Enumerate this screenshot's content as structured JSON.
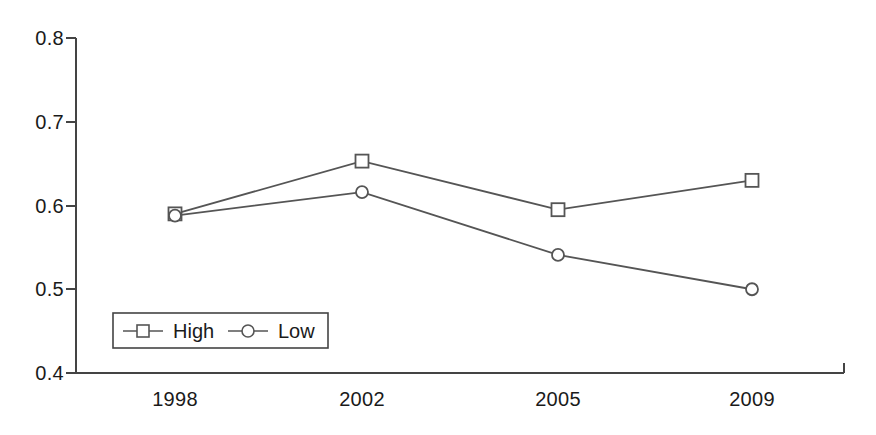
{
  "chart_data": {
    "type": "line",
    "title": "",
    "xlabel": "",
    "ylabel": "",
    "categories": [
      "1998",
      "2002",
      "2005",
      "2009"
    ],
    "series": [
      {
        "name": "High",
        "marker": "square",
        "values": [
          0.59,
          0.653,
          0.595,
          0.63
        ]
      },
      {
        "name": "Low",
        "marker": "circle",
        "values": [
          0.588,
          0.616,
          0.541,
          0.5
        ]
      }
    ],
    "ylim": [
      0.4,
      0.8
    ],
    "y_ticks": [
      0.8,
      0.7,
      0.6,
      0.5,
      0.4
    ],
    "y_tick_labels": [
      "0.8",
      "0.7",
      "0.6",
      "0.5",
      "0.4"
    ],
    "x_tick_labels": [
      "1998",
      "2002",
      "2005",
      "2009"
    ],
    "grid": false,
    "legend_position": "inside-bottom-left",
    "colors": {
      "axis": "#444444",
      "series_high": "#555555",
      "series_low": "#555555",
      "text": "#1a1a1a",
      "background": "#ffffff"
    }
  },
  "legend": {
    "entries": [
      {
        "label": "High",
        "marker": "square-marker"
      },
      {
        "label": "Low",
        "marker": "circle-marker"
      }
    ]
  }
}
